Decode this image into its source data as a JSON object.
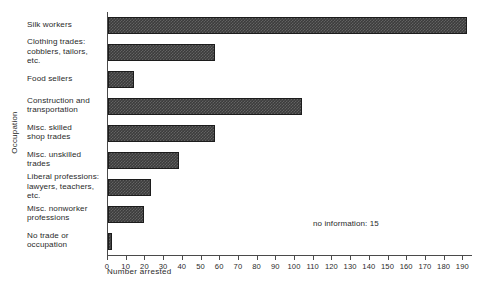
{
  "chart_data": {
    "type": "bar",
    "orientation": "horizontal",
    "title": "",
    "xlabel": "Number arrested",
    "ylabel": "Occupation",
    "xlim": [
      0,
      195
    ],
    "grid": false,
    "legend": null,
    "categories": [
      "Silk workers",
      "Clothing trades: cobblers, tailors, etc.",
      "Food sellers",
      "Construction and transportation",
      "Misc. skilled shop trades",
      "Misc. unskilled trades",
      "Liberal professions: lawyers, teachers, etc.",
      "Misc. nonworker professions",
      "No trade or occupation"
    ],
    "values": [
      192,
      57,
      14,
      104,
      57,
      38,
      23,
      19,
      2
    ],
    "xticks": [
      0,
      10,
      20,
      30,
      40,
      50,
      60,
      70,
      80,
      90,
      100,
      110,
      120,
      130,
      140,
      150,
      160,
      170,
      180,
      190
    ],
    "xticklabels": [
      "0",
      "10",
      "20",
      "30",
      "40",
      "50",
      "60",
      "70",
      "80",
      "90",
      "100",
      "110",
      "120",
      "130",
      "140",
      "150",
      "160",
      "170",
      "180",
      "190"
    ],
    "annotations": [
      {
        "text": "no information: 15",
        "x": 110,
        "y": 1.5
      }
    ],
    "bar_color": "#3c3c3c",
    "axis_color": "#4a4a4a"
  },
  "labels": {
    "category_lines": [
      [
        "Silk workers"
      ],
      [
        "Clothing trades:",
        "cobblers, tailors,",
        "etc."
      ],
      [
        "Food sellers"
      ],
      [
        "Construction and",
        "transportation"
      ],
      [
        "Misc. skilled",
        "shop trades"
      ],
      [
        "Misc. unskilled",
        "trades"
      ],
      [
        "Liberal professions:",
        "lawyers, teachers,",
        "etc."
      ],
      [
        "Misc. nonworker",
        "professions"
      ],
      [
        "No trade or",
        "occupation"
      ]
    ]
  }
}
